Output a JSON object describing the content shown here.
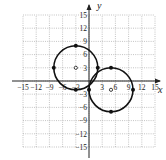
{
  "chart_data": {
    "type": "scatter",
    "title": "",
    "xlabel": "x",
    "ylabel": "y",
    "xlim": [
      -15,
      15
    ],
    "ylim": [
      -15,
      15
    ],
    "grid": true,
    "xticks": [
      -15,
      -12,
      -9,
      -6,
      -3,
      3,
      6,
      9,
      12,
      15
    ],
    "yticks": [
      -15,
      -12,
      -9,
      -6,
      -3,
      3,
      6,
      9,
      12,
      15
    ],
    "xtick_labels": [
      "−15",
      "−12",
      "−9",
      "−6",
      "−3",
      "3",
      "6",
      "9",
      "12",
      "15"
    ],
    "ytick_labels": [
      "−15",
      "−12",
      "−9",
      "−6",
      "−3",
      "3",
      "6",
      "9",
      "12",
      "15"
    ],
    "series": [
      {
        "name": "Circle 1",
        "shape": "circle",
        "center": [
          -3,
          3
        ],
        "radius": 5,
        "points": [
          [
            -8,
            3
          ],
          [
            2,
            3
          ],
          [
            -3,
            8
          ],
          [
            -3,
            -2
          ]
        ]
      },
      {
        "name": "Circle 2",
        "shape": "circle",
        "center": [
          5,
          -2
        ],
        "radius": 5,
        "points": [
          [
            0,
            -2
          ],
          [
            10,
            -2
          ],
          [
            5,
            3
          ],
          [
            5,
            -7
          ]
        ]
      }
    ]
  },
  "labels": {
    "x_axis": "x",
    "y_axis": "y"
  }
}
